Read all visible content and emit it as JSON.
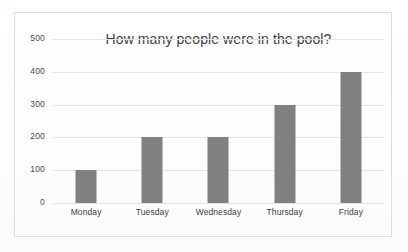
{
  "chart_data": {
    "type": "bar",
    "title": "How many people were in the pool?",
    "categories": [
      "Monday",
      "Tuesday",
      "Wednesday",
      "Thursday",
      "Friday"
    ],
    "values": [
      100,
      200,
      200,
      300,
      400
    ],
    "xlabel": "",
    "ylabel": "",
    "ylim": [
      0,
      500
    ],
    "yticks": [
      0,
      100,
      200,
      300,
      400,
      500
    ],
    "ytick_labels": [
      "0",
      "100",
      "200",
      "300",
      "400",
      "500"
    ],
    "grid": true,
    "legend": false,
    "series": [
      {
        "name": "People in the pool",
        "values": [
          100,
          200,
          200,
          300,
          400
        ]
      }
    ],
    "colors": {
      "bar_fill": "#808080",
      "gridline": "#e3e3e3",
      "title_text": "#3f3f3f",
      "tick_text": "#4a4a4a",
      "frame_border": "#dcdcdc",
      "background": "#ffffff"
    }
  }
}
